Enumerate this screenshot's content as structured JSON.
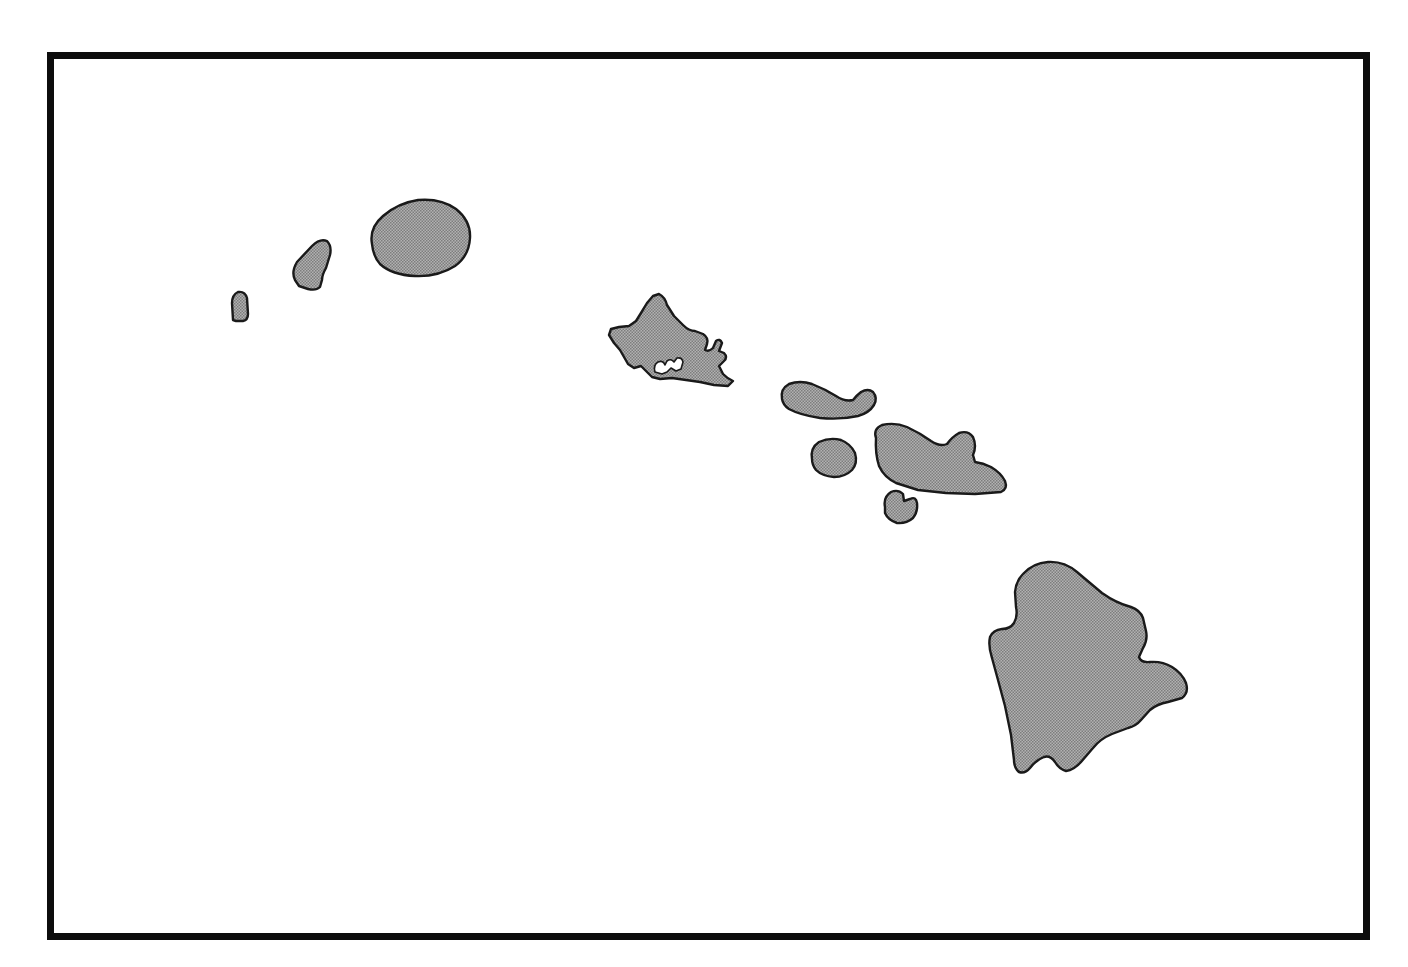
{
  "figure": {
    "name": "hawaii-islands-outline-map",
    "kind": "blank-outline-map",
    "width": 1408,
    "height": 967,
    "has_labels": false,
    "has_legend": false,
    "has_scale_bar": false,
    "has_north_arrow": false,
    "background_color": "#ffffff"
  },
  "frame": {
    "name": "map-border-frame",
    "stroke_color": "#0d0d0d",
    "stroke_width": 7,
    "left": 47,
    "top": 52,
    "right": 1370,
    "bottom": 940
  },
  "style": {
    "land_fill": "#9a9a9a",
    "land_fill_texture": "halftone-dither",
    "coastline_color": "#1a1a1a",
    "coastline_width": 2.4,
    "ocean_fill": "#ffffff"
  },
  "islands": [
    {
      "id": "kaula",
      "name": "Ka'ula",
      "order": 1,
      "relative_size": "smallest",
      "bbox": [
        230,
        291,
        249,
        321
      ],
      "centroid": [
        239,
        306
      ]
    },
    {
      "id": "niihau",
      "name": "Ni'ihau",
      "order": 2,
      "relative_size": "small",
      "bbox": [
        291,
        239,
        331,
        290
      ],
      "centroid": [
        311,
        264
      ]
    },
    {
      "id": "kauai",
      "name": "Kaua'i",
      "order": 3,
      "relative_size": "large",
      "bbox": [
        369,
        199,
        471,
        277
      ],
      "centroid": [
        420,
        238
      ]
    },
    {
      "id": "oahu",
      "name": "O'ahu",
      "order": 4,
      "relative_size": "large",
      "bbox": [
        608,
        294,
        733,
        387
      ],
      "centroid": [
        670,
        340
      ],
      "detail": "pearl-harbor-lochs"
    },
    {
      "id": "molokai",
      "name": "Moloka'i",
      "order": 5,
      "relative_size": "medium",
      "bbox": [
        780,
        381,
        877,
        419
      ],
      "centroid": [
        828,
        400
      ]
    },
    {
      "id": "lanai",
      "name": "Lana'i",
      "order": 6,
      "relative_size": "small",
      "bbox": [
        810,
        438,
        857,
        477
      ],
      "centroid": [
        833,
        457
      ]
    },
    {
      "id": "maui",
      "name": "Maui",
      "order": 7,
      "relative_size": "large",
      "bbox": [
        873,
        423,
        1007,
        494
      ],
      "centroid": [
        940,
        458
      ]
    },
    {
      "id": "kahoolawe",
      "name": "Kaho'olawe",
      "order": 8,
      "relative_size": "small",
      "bbox": [
        883,
        490,
        917,
        524
      ],
      "centroid": [
        900,
        507
      ]
    },
    {
      "id": "hawaii",
      "name": "Hawai'i",
      "order": 9,
      "relative_size": "largest",
      "bbox": [
        986,
        561,
        1189,
        780
      ],
      "centroid": [
        1087,
        670
      ]
    }
  ]
}
